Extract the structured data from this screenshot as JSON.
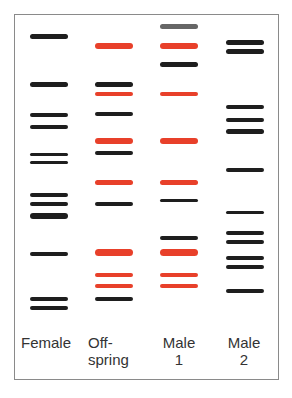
{
  "colors": {
    "black": "#1e1e1e",
    "red": "#e8402a",
    "gray": "#666666",
    "frame": "#8a8a8a",
    "text": "#333333"
  },
  "lanes": [
    {
      "id": "female",
      "label_line1": "Female",
      "label_line2": "",
      "x": 30,
      "label_x": 20,
      "label_w": 52,
      "bands": [
        {
          "y": 36,
          "h": 5,
          "c": "black"
        },
        {
          "y": 84,
          "h": 5,
          "c": "black"
        },
        {
          "y": 115,
          "h": 4,
          "c": "black"
        },
        {
          "y": 127,
          "h": 4,
          "c": "black"
        },
        {
          "y": 154,
          "h": 3,
          "c": "black"
        },
        {
          "y": 162,
          "h": 3,
          "c": "black"
        },
        {
          "y": 195,
          "h": 4,
          "c": "black"
        },
        {
          "y": 204,
          "h": 4,
          "c": "black"
        },
        {
          "y": 216,
          "h": 6,
          "c": "black"
        },
        {
          "y": 254,
          "h": 4,
          "c": "black"
        },
        {
          "y": 299,
          "h": 4,
          "c": "black"
        },
        {
          "y": 308,
          "h": 4,
          "c": "black"
        }
      ]
    },
    {
      "id": "offspring",
      "label_line1": "Off-",
      "label_line2": "spring",
      "x": 95,
      "label_x": 88,
      "label_w": 52,
      "bands": [
        {
          "y": 46,
          "h": 6,
          "c": "red"
        },
        {
          "y": 84,
          "h": 5,
          "c": "black"
        },
        {
          "y": 94,
          "h": 4,
          "c": "red"
        },
        {
          "y": 114,
          "h": 4,
          "c": "black"
        },
        {
          "y": 141,
          "h": 6,
          "c": "red"
        },
        {
          "y": 153,
          "h": 4,
          "c": "black"
        },
        {
          "y": 182,
          "h": 5,
          "c": "red"
        },
        {
          "y": 204,
          "h": 4,
          "c": "black"
        },
        {
          "y": 252,
          "h": 7,
          "c": "red"
        },
        {
          "y": 275,
          "h": 4,
          "c": "red"
        },
        {
          "y": 286,
          "h": 4,
          "c": "red"
        },
        {
          "y": 299,
          "h": 4,
          "c": "black"
        }
      ]
    },
    {
      "id": "male1",
      "label_line1": "Male",
      "label_line2": "1",
      "x": 160,
      "label_x": 156,
      "label_w": 46,
      "bands": [
        {
          "y": 26,
          "h": 5,
          "c": "gray"
        },
        {
          "y": 46,
          "h": 6,
          "c": "red"
        },
        {
          "y": 64,
          "h": 5,
          "c": "black"
        },
        {
          "y": 94,
          "h": 4,
          "c": "red"
        },
        {
          "y": 141,
          "h": 6,
          "c": "red"
        },
        {
          "y": 182,
          "h": 5,
          "c": "red"
        },
        {
          "y": 200,
          "h": 3,
          "c": "black"
        },
        {
          "y": 238,
          "h": 4,
          "c": "black"
        },
        {
          "y": 252,
          "h": 7,
          "c": "red"
        },
        {
          "y": 275,
          "h": 4,
          "c": "red"
        },
        {
          "y": 286,
          "h": 4,
          "c": "red"
        }
      ]
    },
    {
      "id": "male2",
      "label_line1": "Male",
      "label_line2": "2",
      "x": 226,
      "label_x": 222,
      "label_w": 44,
      "bands": [
        {
          "y": 42,
          "h": 5,
          "c": "black"
        },
        {
          "y": 51,
          "h": 5,
          "c": "black"
        },
        {
          "y": 107,
          "h": 4,
          "c": "black"
        },
        {
          "y": 120,
          "h": 4,
          "c": "black"
        },
        {
          "y": 131,
          "h": 5,
          "c": "black"
        },
        {
          "y": 170,
          "h": 4,
          "c": "black"
        },
        {
          "y": 212,
          "h": 3,
          "c": "black"
        },
        {
          "y": 233,
          "h": 4,
          "c": "black"
        },
        {
          "y": 242,
          "h": 4,
          "c": "black"
        },
        {
          "y": 258,
          "h": 4,
          "c": "black"
        },
        {
          "y": 267,
          "h": 4,
          "c": "black"
        },
        {
          "y": 291,
          "h": 4,
          "c": "black"
        }
      ]
    }
  ],
  "band_width": 38,
  "label_y": 334
}
